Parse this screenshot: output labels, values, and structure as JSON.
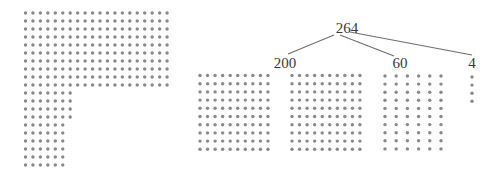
{
  "colors": {
    "dot": "#8a8a8a",
    "line": "#6e6e6e",
    "text": "#3a3a3a",
    "background": "#ffffff"
  },
  "left_group": {
    "total": 264,
    "rows": [
      20,
      20,
      20,
      20,
      20,
      20,
      20,
      20,
      20,
      20,
      7,
      7,
      7,
      7,
      6,
      6,
      6,
      6,
      6,
      6
    ]
  },
  "tree": {
    "root": {
      "label": "264",
      "value": 264
    },
    "children": [
      {
        "label": "200",
        "value": 200,
        "blocks": [
          {
            "cols": 10,
            "rows": 10
          },
          {
            "cols": 10,
            "rows": 10
          }
        ]
      },
      {
        "label": "60",
        "value": 60,
        "blocks": [
          {
            "cols": 6,
            "rows": 10
          }
        ]
      },
      {
        "label": "4",
        "value": 4,
        "blocks": [
          {
            "cols": 1,
            "rows": 4
          }
        ]
      }
    ]
  }
}
